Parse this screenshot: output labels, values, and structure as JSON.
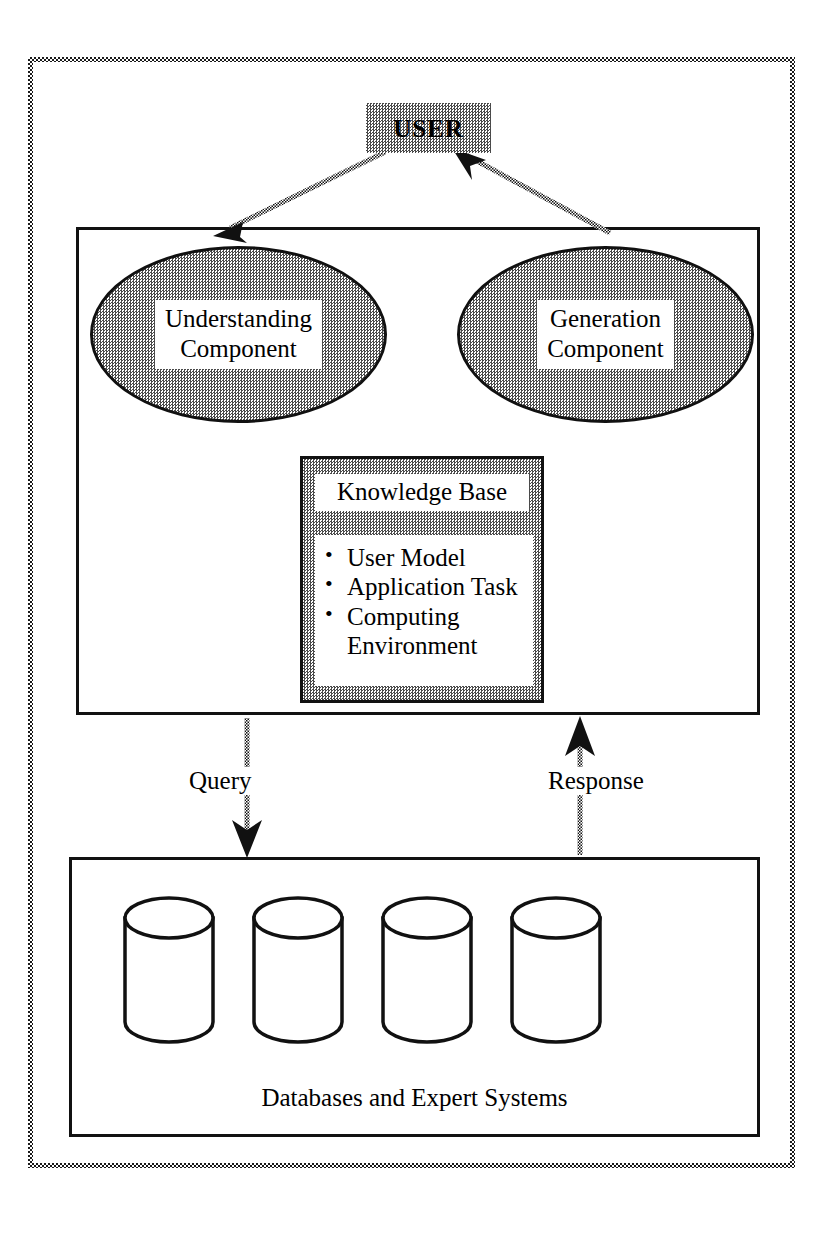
{
  "diagram": {
    "title_text": "",
    "user": {
      "label": "USER",
      "fill": "halftone-gray"
    },
    "system": {
      "components": [
        {
          "id": "understanding",
          "label": "Understanding\nComponent",
          "line1": "Understanding",
          "line2": "Component",
          "shape": "ellipse"
        },
        {
          "id": "generation",
          "label": "Generation\nComponent",
          "line1": "Generation",
          "line2": "Component",
          "shape": "ellipse"
        }
      ],
      "knowledge_base": {
        "title": "Knowledge Base",
        "items": [
          "User Model",
          "Application Task",
          "Computing\nEnvironment"
        ]
      }
    },
    "flows": [
      {
        "id": "query",
        "label": "Query",
        "direction": "down"
      },
      {
        "id": "response",
        "label": "Response",
        "direction": "up"
      }
    ],
    "user_links": [
      {
        "id": "user-to-understanding",
        "direction": "down-left"
      },
      {
        "id": "generation-to-user",
        "direction": "up-right"
      }
    ],
    "datastore": {
      "label": "Databases and Expert Systems",
      "cylinder_count": 4,
      "cylinders": [
        "db-1",
        "db-2",
        "db-3",
        "db-4"
      ]
    },
    "colors": {
      "ink": "#000000",
      "paper": "#ffffff",
      "halftone": "#4a4a4a"
    }
  }
}
